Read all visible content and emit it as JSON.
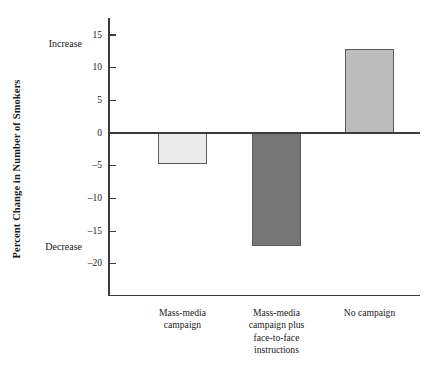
{
  "chart_data": {
    "type": "bar",
    "title": "",
    "subtitle": "",
    "xlabel": "",
    "ylabel": "Percent Change in Number of Smokers",
    "categories": [
      "Mass-media campaign",
      "Mass-media campaign plus face-to-face instructions",
      "No campaign"
    ],
    "category_lines": [
      [
        "Mass-media",
        "campaign"
      ],
      [
        "Mass-media",
        "campaign plus",
        "face-to-face",
        "instructions"
      ],
      [
        "No campaign"
      ]
    ],
    "values": [
      -4.8,
      -17.2,
      12.8
    ],
    "bar_colors": [
      "#ebebeb",
      "#767676",
      "#bcbcbc"
    ],
    "bar_edge_color": "#5c5c5c",
    "ylim": [
      -22.5,
      17.5
    ],
    "yticks": [
      15,
      10,
      5,
      0,
      -5,
      -10,
      -15,
      -20
    ],
    "ytick_labels": [
      "15",
      "10",
      "5",
      "0",
      "–5",
      "–10",
      "–15",
      "–20"
    ],
    "grid": false,
    "legend": "none",
    "annotations": [
      {
        "text": "Increase",
        "position": "upper-left-of-axis"
      },
      {
        "text": "Decrease",
        "position": "lower-left-of-axis"
      }
    ],
    "zero_reference_line": true,
    "axis_color": "#3b3b3b"
  },
  "axis": {
    "y_title": "Percent Change in Number of Smokers",
    "increase_label": "Increase",
    "decrease_label": "Decrease"
  }
}
